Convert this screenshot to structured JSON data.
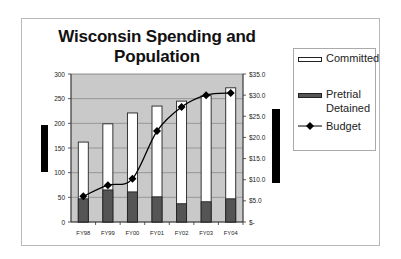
{
  "chart_data": {
    "type": "bar",
    "title": "Wisconsin Spending and Population",
    "categories": [
      "FY98",
      "FY99",
      "FY00",
      "FY01",
      "FY02",
      "FY03",
      "FY04"
    ],
    "series": [
      {
        "name": "Committed",
        "kind": "bar",
        "axis": "left",
        "color": "#ffffff",
        "values": [
          162,
          199,
          221,
          235,
          245,
          256,
          272
        ]
      },
      {
        "name": "Pretrial Detained",
        "kind": "bar",
        "axis": "left",
        "color": "#555555",
        "values": [
          47,
          65,
          61,
          51,
          37,
          41,
          47
        ]
      },
      {
        "name": "Budget",
        "kind": "line",
        "axis": "right",
        "color": "#000000",
        "values": [
          6.1,
          8.7,
          10.2,
          21.5,
          27.2,
          30.0,
          30.5
        ]
      }
    ],
    "xlabel": "",
    "ylabel": "",
    "ylim": [
      0,
      300
    ],
    "y_ticks": [
      "0",
      "50",
      "100",
      "150",
      "200",
      "250",
      "300"
    ],
    "y2lim": [
      0,
      35
    ],
    "y2_ticks": [
      "$-",
      "$5.0",
      "$10.0",
      "$15.0",
      "$20.0",
      "$25.0",
      "$30.0",
      "$35.0"
    ],
    "grid": true,
    "legend_position": "right",
    "plot_background": "#c9c9c9"
  },
  "legend": {
    "committed": "Committed",
    "pretrial_line1": "Pretrial",
    "pretrial_line2": "Detained",
    "budget": "Budget"
  }
}
